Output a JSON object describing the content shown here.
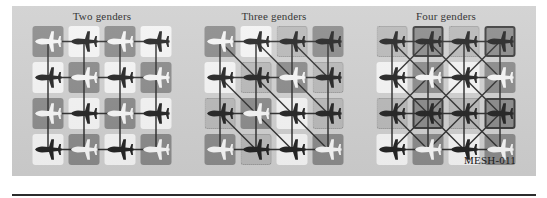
{
  "figure": {
    "caption": "MESH-011",
    "background_color": "#cfcfcf",
    "page_background": "#ffffff",
    "rule_color": "#2b2b2b"
  },
  "legend_colors": {
    "gender_dark": "#8a8a8a",
    "gender_light": "#f4f4f4",
    "gender_mid": "#b8b8b8",
    "gender_outlined_border": "#3a3a3a",
    "node_dark": "#222222",
    "node_light": "#f5f5f5",
    "edge_color": "#2e2e2e",
    "dotted_border": "#8d8d8d"
  },
  "panels": [
    {
      "id": "two-genders",
      "title": "Two genders",
      "grid_rows": 4,
      "grid_cols": 4,
      "cell_types": [
        [
          "dark",
          "light",
          "dark",
          "light"
        ],
        [
          "light",
          "dark",
          "light",
          "dark"
        ],
        [
          "dark",
          "light",
          "dark",
          "light"
        ],
        [
          "light",
          "dark",
          "light",
          "dark"
        ]
      ],
      "node_colors": [
        [
          "light",
          "dark",
          "light",
          "dark"
        ],
        [
          "dark",
          "light",
          "dark",
          "light"
        ],
        [
          "light",
          "dark",
          "light",
          "dark"
        ],
        [
          "dark",
          "light",
          "dark",
          "light"
        ]
      ],
      "edges": [
        "horizontal",
        "vertical"
      ],
      "diagonals": "none"
    },
    {
      "id": "three-genders",
      "title": "Three genders",
      "grid_rows": 4,
      "grid_cols": 4,
      "cell_types": [
        [
          "dark",
          "light",
          "mid",
          "dark"
        ],
        [
          "light",
          "mid",
          "dark",
          "mid"
        ],
        [
          "mid",
          "dark",
          "light",
          "mid"
        ],
        [
          "dark",
          "mid",
          "light",
          "dark"
        ]
      ],
      "node_colors": [
        [
          "light",
          "dark",
          "dark",
          "dark"
        ],
        [
          "dark",
          "dark",
          "light",
          "dark"
        ],
        [
          "dark",
          "light",
          "dark",
          "dark"
        ],
        [
          "light",
          "dark",
          "dark",
          "light"
        ]
      ],
      "edges": [
        "horizontal",
        "vertical"
      ],
      "diagonals": "down-right"
    },
    {
      "id": "four-genders",
      "title": "Four genders",
      "grid_rows": 4,
      "grid_cols": 4,
      "cell_types": [
        [
          "mid",
          "outlined",
          "mid",
          "outlined"
        ],
        [
          "light",
          "dark",
          "light",
          "dark"
        ],
        [
          "mid",
          "outlined",
          "mid",
          "outlined"
        ],
        [
          "light",
          "dark",
          "light",
          "dark"
        ]
      ],
      "node_colors": [
        [
          "dark",
          "dark",
          "dark",
          "dark"
        ],
        [
          "dark",
          "light",
          "dark",
          "light"
        ],
        [
          "dark",
          "dark",
          "dark",
          "dark"
        ],
        [
          "dark",
          "light",
          "dark",
          "light"
        ]
      ],
      "edges": [
        "horizontal",
        "vertical"
      ],
      "diagonals": "both"
    }
  ]
}
